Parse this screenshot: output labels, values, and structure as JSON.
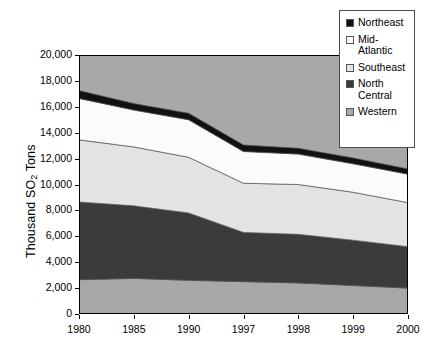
{
  "chart_data": {
    "type": "area",
    "title": "",
    "subtitle": "",
    "xlabel": "",
    "ylabel": "Thousand SO2 Tons",
    "ylabel_parts": {
      "prefix": "Thousand SO",
      "sub": "2",
      "suffix": " Tons"
    },
    "categories": [
      "1980",
      "1985",
      "1990",
      "1997",
      "1998",
      "1999",
      "2000"
    ],
    "stacked": true,
    "stack_order_bottom_to_top": [
      "Western",
      "North Central",
      "Southeast",
      "Mid-Atlantic",
      "Northeast"
    ],
    "series": [
      {
        "name": "Northeast",
        "color": "#111111",
        "values": [
          600,
          500,
          500,
          500,
          450,
          450,
          400
        ]
      },
      {
        "name": "Mid-Atlantic",
        "color": "#fbfbfb",
        "values": [
          3200,
          2850,
          2900,
          2450,
          2350,
          2200,
          2200
        ]
      },
      {
        "name": "Southeast",
        "color": "#e3e3e3",
        "values": [
          4800,
          4550,
          4300,
          3800,
          3850,
          3700,
          3400
        ]
      },
      {
        "name": "North Central",
        "color": "#3b3b3b",
        "values": [
          6000,
          5600,
          5200,
          3800,
          3750,
          3500,
          3200
        ]
      },
      {
        "name": "Western",
        "color": "#a8a8a8",
        "values": [
          2650,
          2750,
          2600,
          2500,
          2400,
          2200,
          2000
        ]
      }
    ],
    "cumulative_tops": {
      "Western": [
        2650,
        2750,
        2600,
        2500,
        2400,
        2200,
        2000
      ],
      "North Central": [
        8650,
        8350,
        7800,
        6300,
        6150,
        5700,
        5200
      ],
      "Southeast": [
        13450,
        12900,
        12100,
        10100,
        10000,
        9400,
        8600
      ],
      "Mid-Atlantic": [
        16650,
        15750,
        15000,
        12550,
        12350,
        11600,
        10800
      ],
      "Northeast": [
        17250,
        16250,
        15500,
        13050,
        12800,
        12050,
        11200
      ]
    },
    "ylim": [
      0,
      20000
    ],
    "ytick_step": 2000,
    "ytick_labels": [
      "20,000",
      "18,000",
      "16,000",
      "14,000",
      "12,000",
      "10,000",
      "8,000",
      "6,000",
      "4,000",
      "2,000",
      "0"
    ],
    "ytick_values": [
      20000,
      18000,
      16000,
      14000,
      12000,
      10000,
      8000,
      6000,
      4000,
      2000,
      0
    ],
    "grid": false,
    "legend_position": "top-right",
    "legend": [
      {
        "label": "Northeast",
        "color": "#111111"
      },
      {
        "label": "Mid-Atlantic",
        "color": "#fbfbfb"
      },
      {
        "label": "Southeast",
        "color": "#e3e3e3"
      },
      {
        "label": "North Central",
        "color": "#3b3b3b"
      },
      {
        "label": "Western",
        "color": "#a8a8a8"
      }
    ],
    "plot_background": "#a8a8a8"
  },
  "legend": {
    "items": [
      {
        "label": "Northeast"
      },
      {
        "label": "Mid-Atlantic"
      },
      {
        "label": "Southeast"
      },
      {
        "label": "North Central"
      },
      {
        "label": "Western"
      }
    ]
  }
}
